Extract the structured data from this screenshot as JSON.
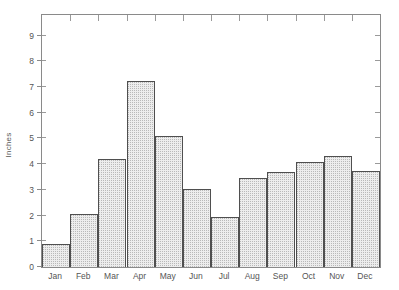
{
  "chart_data": {
    "type": "bar",
    "title": "",
    "subtitle": "",
    "xlabel": "",
    "ylabel": "Inches",
    "categories": [
      "Jan",
      "Feb",
      "Mar",
      "Apr",
      "May",
      "Jun",
      "Jul",
      "Aug",
      "Sep",
      "Oct",
      "Nov",
      "Dec"
    ],
    "values": [
      0.9,
      2.05,
      4.2,
      7.25,
      5.1,
      3.05,
      1.95,
      3.45,
      3.7,
      4.1,
      4.3,
      3.75
    ],
    "ylim": [
      0,
      9.8
    ],
    "ytick_labels": [
      "0",
      "1",
      "2",
      "3",
      "4",
      "5",
      "6",
      "7",
      "8",
      "9"
    ],
    "ytick_values": [
      0,
      1,
      2,
      3,
      4,
      5,
      6,
      7,
      8,
      9
    ],
    "grid": false,
    "legend": "none",
    "bar_gap": 0,
    "bar_fill_color": "#ededed",
    "bar_edge_color": "#4f4f4f",
    "axis_color": "#8a8a8a",
    "background_color": "#ffffff",
    "text_color": "#555555"
  }
}
